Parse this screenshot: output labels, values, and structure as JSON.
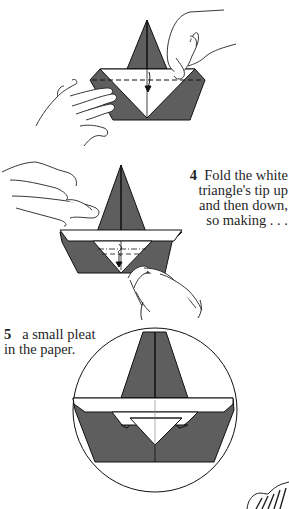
{
  "page": {
    "type": "origami instruction page",
    "colors": {
      "paper_dark": "#5e5e5e",
      "paper_light": "#ffffff",
      "line": "#111111"
    }
  },
  "steps": [
    {
      "number": "4",
      "lines": [
        "Fold the white",
        "triangle's tip up",
        "and then down,",
        "so making . . ."
      ]
    },
    {
      "number": "5",
      "lines": [
        "a small pleat",
        "in the paper."
      ]
    }
  ],
  "diagrams": [
    {
      "name": "step-3-fold-diagram",
      "description": "boat with hands folding along dashed line, arrow down"
    },
    {
      "name": "step-4-fold-diagram",
      "description": "boat with white triangle, pleat lines, arrow down"
    },
    {
      "name": "step-5-result-diagram",
      "description": "circled close-up of boat with small pleat"
    }
  ]
}
